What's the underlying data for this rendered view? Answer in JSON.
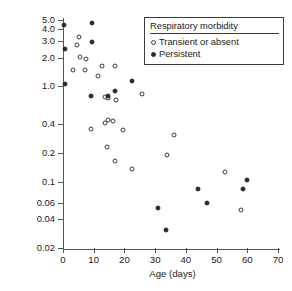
{
  "chart_data": {
    "type": "scatter",
    "title": "",
    "xlabel": "Age (days)",
    "ylabel": "Percent fractional sodium excretion",
    "xlim": [
      0,
      70
    ],
    "ylim": [
      0.02,
      5.0
    ],
    "yscale": "log",
    "xscale": "linear",
    "grid": false,
    "xticks": [
      0,
      10,
      20,
      30,
      40,
      50,
      60,
      70
    ],
    "xtick_labels": [
      "0",
      "10",
      "20",
      "30",
      "40",
      "50",
      "60",
      "70"
    ],
    "yticks": [
      0.02,
      0.04,
      0.06,
      0.1,
      0.2,
      0.4,
      1.0,
      2.0,
      3.0,
      4.0,
      5.0
    ],
    "ytick_labels": [
      "0.02",
      "0.04",
      "0.06",
      "0.1",
      "0.2",
      "0.4",
      "1.0",
      "2.0",
      "3.0",
      "4.0",
      "5.0"
    ],
    "legend": {
      "title": "Respiratory morbidity",
      "position": "top-right",
      "entries": [
        {
          "label": "Transient or absent",
          "marker": "open-circle"
        },
        {
          "label": "Persistent",
          "marker": "filled-circle"
        }
      ]
    },
    "series": [
      {
        "name": "Transient or absent",
        "marker": "open-circle",
        "points": [
          [
            3.2,
            1.5
          ],
          [
            5.2,
            3.3
          ],
          [
            4.6,
            2.7
          ],
          [
            5.6,
            2.05
          ],
          [
            7.4,
            1.95
          ],
          [
            7.0,
            1.5
          ],
          [
            11.4,
            1.3
          ],
          [
            12.8,
            1.65
          ],
          [
            16.8,
            1.65
          ],
          [
            13.6,
            0.78
          ],
          [
            14.6,
            0.75
          ],
          [
            17.4,
            0.72
          ],
          [
            25.6,
            0.83
          ],
          [
            9.0,
            0.36
          ],
          [
            13.6,
            0.41
          ],
          [
            14.6,
            0.44
          ],
          [
            16.2,
            0.43
          ],
          [
            19.6,
            0.35
          ],
          [
            14.2,
            0.23
          ],
          [
            17.0,
            0.165
          ],
          [
            22.4,
            0.135
          ],
          [
            33.8,
            0.19
          ],
          [
            36.2,
            0.31
          ],
          [
            52.8,
            0.125
          ],
          [
            57.8,
            0.05
          ]
        ]
      },
      {
        "name": "Persistent",
        "marker": "filled-circle",
        "points": [
          [
            0.4,
            4.4
          ],
          [
            0.6,
            2.5
          ],
          [
            0.6,
            1.05
          ],
          [
            9.6,
            4.7
          ],
          [
            9.6,
            2.9
          ],
          [
            9.0,
            0.79
          ],
          [
            14.6,
            0.79
          ],
          [
            16.8,
            0.9
          ],
          [
            22.6,
            1.15
          ],
          [
            31.0,
            0.053
          ],
          [
            33.6,
            0.031
          ],
          [
            44.0,
            0.083
          ],
          [
            47.0,
            0.06
          ],
          [
            58.6,
            0.084
          ],
          [
            60.0,
            0.105
          ]
        ]
      }
    ]
  }
}
